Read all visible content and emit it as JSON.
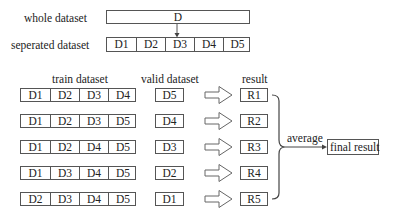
{
  "top": {
    "whole_label": "whole dataset",
    "whole_box": "D",
    "separated_label": "seperated dataset",
    "separated_parts": [
      "D1",
      "D2",
      "D3",
      "D4",
      "D5"
    ]
  },
  "headers": {
    "train": "train dataset",
    "valid": "valid dataset",
    "result": "result"
  },
  "folds": [
    {
      "train": [
        "D1",
        "D2",
        "D3",
        "D4"
      ],
      "valid": "D5",
      "result": "R1"
    },
    {
      "train": [
        "D1",
        "D2",
        "D3",
        "D5"
      ],
      "valid": "D4",
      "result": "R2"
    },
    {
      "train": [
        "D1",
        "D2",
        "D4",
        "D5"
      ],
      "valid": "D3",
      "result": "R3"
    },
    {
      "train": [
        "D1",
        "D3",
        "D4",
        "D5"
      ],
      "valid": "D2",
      "result": "R4"
    },
    {
      "train": [
        "D2",
        "D3",
        "D4",
        "D5"
      ],
      "valid": "D1",
      "result": "R5"
    }
  ],
  "aggregate": {
    "label": "average",
    "final": "final result"
  },
  "colors": {
    "stroke": "#555555",
    "text": "#222222",
    "background": "#ffffff"
  }
}
